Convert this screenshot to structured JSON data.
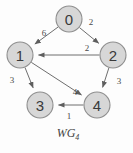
{
  "figure": {
    "caption_main": "WG",
    "caption_subscript": "4",
    "caption_full": "WG4"
  },
  "chart_data": {
    "type": "diagram",
    "diagram_kind": "directed-weighted-graph",
    "title": "WG4",
    "node_fill_color": "#d7d7d7",
    "node_stroke_color": "#8e8e8e",
    "edge_color": "#6e6e6e",
    "background_color": "#fdfdfd",
    "nodes": [
      {
        "id": "0",
        "label": "0",
        "x": 69,
        "y": 19,
        "r": 13
      },
      {
        "id": "1",
        "label": "1",
        "x": 20,
        "y": 55,
        "r": 13
      },
      {
        "id": "2",
        "label": "2",
        "x": 113,
        "y": 55,
        "r": 13
      },
      {
        "id": "3",
        "label": "3",
        "x": 40,
        "y": 105,
        "r": 13
      },
      {
        "id": "4",
        "label": "4",
        "x": 97,
        "y": 105,
        "r": 13
      }
    ],
    "edges": [
      {
        "from": "0",
        "to": "1",
        "weight": "6",
        "directed": true,
        "label_x": 44,
        "label_y": 33
      },
      {
        "from": "0",
        "to": "2",
        "weight": "2",
        "directed": true,
        "label_x": 91,
        "label_y": 22
      },
      {
        "from": "2",
        "to": "1",
        "weight": "2",
        "directed": true,
        "label_x": 87,
        "label_y": 48
      },
      {
        "from": "1",
        "to": "3",
        "weight": "3",
        "directed": true,
        "label_x": 12,
        "label_y": 80
      },
      {
        "from": "1",
        "to": "4",
        "weight": "4",
        "directed": true,
        "label_x": 75,
        "label_y": 92
      },
      {
        "from": "2",
        "to": "4",
        "weight": "3",
        "directed": true,
        "label_x": 119,
        "label_y": 81
      },
      {
        "from": "4",
        "to": "3",
        "weight": "1",
        "directed": true,
        "label_x": 69,
        "label_y": 116
      }
    ]
  }
}
